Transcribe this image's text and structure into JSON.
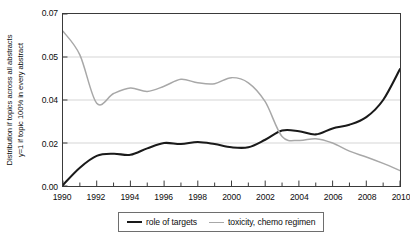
{
  "chart_data": {
    "type": "line",
    "title": "",
    "xlabel": "",
    "ylabel_lines": [
      "Distribution if topics across all abstracts",
      "y=1 if topic 100% in every abstract"
    ],
    "xlim": [
      1990,
      2010
    ],
    "ylim": [
      0.0,
      0.07
    ],
    "grid": true,
    "grid_axis": "y",
    "legend_position": "bottom-center",
    "xticks_major": [
      1990,
      1992,
      1994,
      1996,
      1998,
      2000,
      2002,
      2004,
      2006,
      2008,
      2010
    ],
    "xticks_minor": [
      1991,
      1993,
      1995,
      1997,
      1999,
      2001,
      2003,
      2005,
      2007,
      2009
    ],
    "xtick_labels": [
      "1990",
      "1992",
      "1994",
      "1996",
      "1998",
      "2000",
      "2002",
      "2004",
      "2006",
      "2008",
      "2010"
    ],
    "ytick_values": [
      0.07,
      0.05,
      0.04,
      0.02,
      0.0
    ],
    "ytick_labels": [
      "0.07",
      "0.05",
      "0.04",
      "0.02",
      "0.00"
    ],
    "x": [
      1990,
      1991,
      1992,
      1993,
      1994,
      1995,
      1996,
      1997,
      1998,
      1999,
      2000,
      2001,
      2002,
      2003,
      2004,
      2005,
      2006,
      2007,
      2008,
      2009,
      2010
    ],
    "series": [
      {
        "name": "role of targets",
        "color": "#1a1a1a",
        "values": [
          0.0005,
          0.0085,
          0.014,
          0.015,
          0.0145,
          0.0175,
          0.02,
          0.0195,
          0.0205,
          0.0195,
          0.018,
          0.018,
          0.0215,
          0.0258,
          0.0255,
          0.024,
          0.0268,
          0.0285,
          0.032,
          0.04,
          0.0472
        ]
      },
      {
        "name": "toxicity, chemo regimen",
        "color": "#a8a8a8",
        "values": [
          0.062,
          0.051,
          0.0385,
          0.0415,
          0.0428,
          0.042,
          0.0432,
          0.0448,
          0.044,
          0.0438,
          0.0452,
          0.044,
          0.0392,
          0.023,
          0.0212,
          0.022,
          0.02,
          0.0162,
          0.0135,
          0.0105,
          0.0072
        ]
      }
    ]
  },
  "legend": {
    "items": [
      {
        "label": "role of targets",
        "style": "dark"
      },
      {
        "label": "toxicity, chemo regimen",
        "style": "light"
      }
    ]
  }
}
